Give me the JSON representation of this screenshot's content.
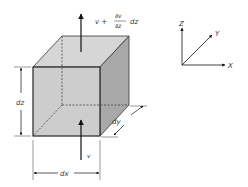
{
  "diagram": {
    "labels": {
      "flow_out": "v +",
      "frac_num": "∂v",
      "frac_den": "∂z",
      "flow_out_suffix": "dz",
      "flow_in": "v",
      "dx": "dx",
      "dy": "dy",
      "dz": "dz"
    },
    "axes": {
      "x": "X",
      "y": "Y",
      "z": "Z"
    },
    "colors": {
      "front_face": "#c4c4c4",
      "top_face": "#d6d6d6",
      "side_face": "#a8a8a8",
      "edge": "#333333",
      "arrow": "#111111"
    }
  }
}
